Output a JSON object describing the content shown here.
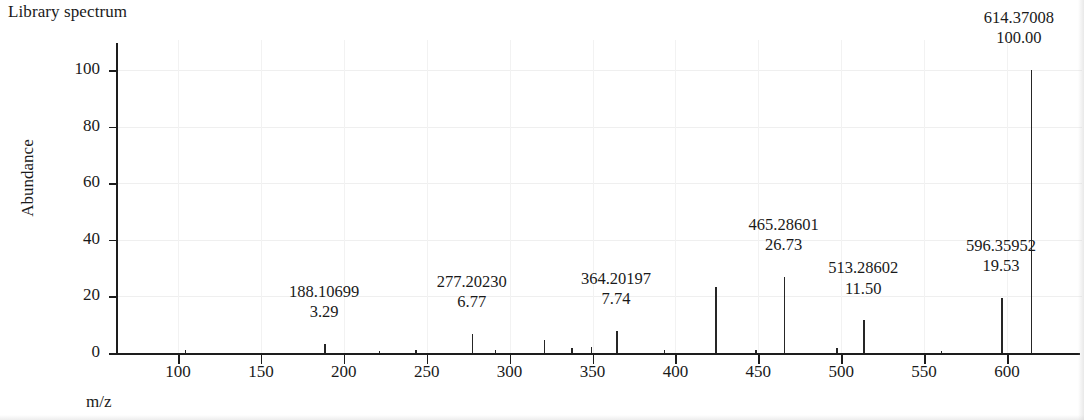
{
  "title": "Library spectrum",
  "axes": {
    "ylabel": "Abundance",
    "xlabel": "m/z",
    "yticks": [
      "0",
      "20",
      "40",
      "60",
      "80",
      "100"
    ],
    "xticks": [
      "100",
      "150",
      "200",
      "250",
      "300",
      "350",
      "400",
      "450",
      "500",
      "550",
      "600"
    ]
  },
  "chart_data": {
    "type": "bar",
    "title": "Library spectrum",
    "xlabel": "m/z",
    "ylabel": "Abundance",
    "xlim": [
      72,
      625
    ],
    "ylim": [
      0,
      107
    ],
    "grid": "light horizontal and vertical gridlines",
    "legend": "none",
    "x": [
      104.0,
      188.10699,
      221.0,
      243.0,
      277.2023,
      291.0,
      320.5,
      337.0,
      349.0,
      364.20197,
      393.0,
      424.0,
      448.0,
      465.28601,
      497.0,
      513.28602,
      560.0,
      596.35952,
      614.37008
    ],
    "values": [
      0.9,
      3.29,
      0.7,
      1.1,
      6.77,
      1.0,
      4.6,
      1.7,
      2.0,
      7.74,
      1.2,
      23.2,
      1.1,
      26.73,
      1.6,
      11.5,
      0.8,
      19.53,
      100.0
    ],
    "labeled_peaks": [
      {
        "mz": "188.10699",
        "abundance": "3.29",
        "mz_value": 188.10699,
        "abundance_value": 3.29
      },
      {
        "mz": "277.20230",
        "abundance": "6.77",
        "mz_value": 277.2023,
        "abundance_value": 6.77
      },
      {
        "mz": "364.20197",
        "abundance": "7.74",
        "mz_value": 364.20197,
        "abundance_value": 7.74
      },
      {
        "mz": "465.28601",
        "abundance": "26.73",
        "mz_value": 465.28601,
        "abundance_value": 26.73
      },
      {
        "mz": "513.28602",
        "abundance": "11.50",
        "mz_value": 513.28602,
        "abundance_value": 11.5
      },
      {
        "mz": "596.35952",
        "abundance": "19.53",
        "mz_value": 596.35952,
        "abundance_value": 19.53
      },
      {
        "mz": "614.37008",
        "abundance": "100.00",
        "mz_value": 614.37008,
        "abundance_value": 100.0
      }
    ]
  }
}
